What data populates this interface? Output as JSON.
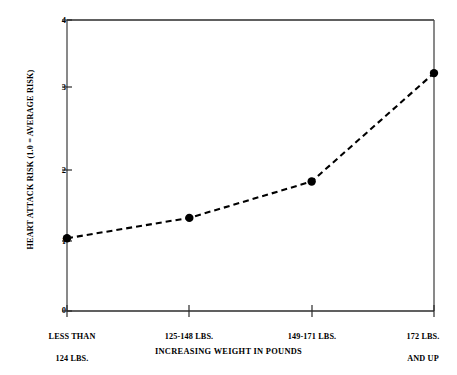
{
  "chart_data": {
    "type": "line",
    "title": "",
    "xlabel": "INCREASING WEIGHT IN POUNDS",
    "ylabel": "HEART ATTACK RISK (1.0 = AVERAGE RISK)",
    "categories": [
      "LESS THAN\n124 LBS.",
      "125-148 LBS.",
      "149-171 LBS.",
      "172 LBS.\nAND UP"
    ],
    "values": [
      1.0,
      1.28,
      1.78,
      3.27
    ],
    "series": [
      {
        "name": "Heart attack risk",
        "values": [
          1.0,
          1.28,
          1.78,
          3.27
        ]
      }
    ],
    "ylim": [
      0,
      4
    ],
    "y_ticks": [
      "0",
      "1",
      "2",
      "3",
      "4"
    ],
    "y_tick_values": [
      0,
      1,
      2,
      3,
      4
    ],
    "grid": false,
    "legend": "none",
    "line_style": "dashed",
    "marker": "filled-circle",
    "line_color": "#000000",
    "marker_color": "#000000",
    "background_color": "#ffffff"
  },
  "axes": {
    "y_title": "HEART ATTACK RISK (1.0 = AVERAGE RISK)",
    "x_title": "INCREASING WEIGHT IN POUNDS",
    "y_labels": [
      "4",
      "3",
      "2",
      "1",
      "0"
    ],
    "x_labels": [
      {
        "line1": "LESS THAN",
        "line2": "124 LBS."
      },
      {
        "line1": "125-148 LBS.",
        "line2": ""
      },
      {
        "line1": "149-171 LBS.",
        "line2": ""
      },
      {
        "line1": "172 LBS.",
        "line2": "AND UP"
      }
    ]
  }
}
